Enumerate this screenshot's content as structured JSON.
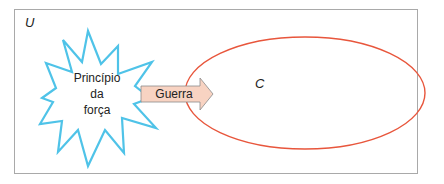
{
  "diagram": {
    "universe_label": "U",
    "set_label": "C",
    "star_label_lines": [
      "Princípio",
      "da",
      "força"
    ],
    "arrow_label": "Guerra",
    "colors": {
      "star_stroke": "#4fc3e8",
      "ellipse_stroke": "#e8563c",
      "arrow_fill": "#f8d3c2",
      "arrow_stroke": "#8a8a8a",
      "frame_stroke": "#a9a9a9"
    }
  }
}
